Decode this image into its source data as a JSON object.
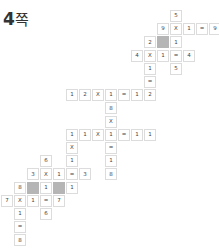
{
  "page": {
    "title_number": "4",
    "title_unit": "쪽"
  },
  "grid": {
    "cell_size": 13,
    "colors": {
      "border": "#dcdcdc",
      "blank": "#b5b5b5",
      "text": "#444444"
    },
    "cells": [
      {
        "r": 0,
        "c": 13,
        "v": "5"
      },
      {
        "r": 1,
        "c": 12,
        "v": "9"
      },
      {
        "r": 1,
        "c": 13,
        "v": "X"
      },
      {
        "r": 1,
        "c": 14,
        "v": "1"
      },
      {
        "r": 1,
        "c": 15,
        "v": "="
      },
      {
        "r": 1,
        "c": 16,
        "v": "9"
      },
      {
        "r": 2,
        "c": 11,
        "v": "2"
      },
      {
        "r": 2,
        "c": 12,
        "v": "",
        "blank": true
      },
      {
        "r": 2,
        "c": 13,
        "v": "1"
      },
      {
        "r": 3,
        "c": 10,
        "v": "4"
      },
      {
        "r": 3,
        "c": 11,
        "v": "X"
      },
      {
        "r": 3,
        "c": 12,
        "v": "1"
      },
      {
        "r": 3,
        "c": 13,
        "v": "="
      },
      {
        "r": 3,
        "c": 14,
        "v": "4"
      },
      {
        "r": 4,
        "c": 11,
        "v": "1"
      },
      {
        "r": 4,
        "c": 13,
        "v": "5"
      },
      {
        "r": 5,
        "c": 11,
        "v": "="
      },
      {
        "r": 6,
        "c": 5,
        "v": "1"
      },
      {
        "r": 6,
        "c": 6,
        "v": "2"
      },
      {
        "r": 6,
        "c": 7,
        "v": "X"
      },
      {
        "r": 6,
        "c": 8,
        "v": "1"
      },
      {
        "r": 6,
        "c": 9,
        "v": "="
      },
      {
        "r": 6,
        "c": 10,
        "v": "1"
      },
      {
        "r": 6,
        "c": 11,
        "v": "2"
      },
      {
        "r": 7,
        "c": 8,
        "v": "8"
      },
      {
        "r": 8,
        "c": 8,
        "v": "X"
      },
      {
        "r": 9,
        "c": 5,
        "v": "1"
      },
      {
        "r": 9,
        "c": 6,
        "v": "1"
      },
      {
        "r": 9,
        "c": 7,
        "v": "X"
      },
      {
        "r": 9,
        "c": 8,
        "v": "1"
      },
      {
        "r": 9,
        "c": 9,
        "v": "="
      },
      {
        "r": 9,
        "c": 10,
        "v": "1"
      },
      {
        "r": 9,
        "c": 11,
        "v": "1"
      },
      {
        "r": 10,
        "c": 5,
        "v": "X"
      },
      {
        "r": 10,
        "c": 8,
        "v": "="
      },
      {
        "r": 11,
        "c": 3,
        "v": "6"
      },
      {
        "r": 11,
        "c": 5,
        "v": "1"
      },
      {
        "r": 11,
        "c": 8,
        "v": "1"
      },
      {
        "r": 12,
        "c": 2,
        "v": "3"
      },
      {
        "r": 12,
        "c": 3,
        "v": "X"
      },
      {
        "r": 12,
        "c": 4,
        "v": "1"
      },
      {
        "r": 12,
        "c": 5,
        "v": "="
      },
      {
        "r": 12,
        "c": 6,
        "v": "3"
      },
      {
        "r": 12,
        "c": 8,
        "v": "8"
      },
      {
        "r": 13,
        "c": 1,
        "v": "8"
      },
      {
        "r": 13,
        "c": 2,
        "v": "",
        "blank": true
      },
      {
        "r": 13,
        "c": 3,
        "v": "1"
      },
      {
        "r": 13,
        "c": 4,
        "v": "",
        "blank": true
      },
      {
        "r": 13,
        "c": 5,
        "v": "1"
      },
      {
        "r": 14,
        "c": 0,
        "v": "7"
      },
      {
        "r": 14,
        "c": 1,
        "v": "X"
      },
      {
        "r": 14,
        "c": 2,
        "v": "1"
      },
      {
        "r": 14,
        "c": 3,
        "v": "="
      },
      {
        "r": 14,
        "c": 4,
        "v": "7"
      },
      {
        "r": 15,
        "c": 1,
        "v": "1"
      },
      {
        "r": 15,
        "c": 3,
        "v": "6"
      },
      {
        "r": 16,
        "c": 1,
        "v": "="
      },
      {
        "r": 17,
        "c": 1,
        "v": "8"
      }
    ]
  }
}
